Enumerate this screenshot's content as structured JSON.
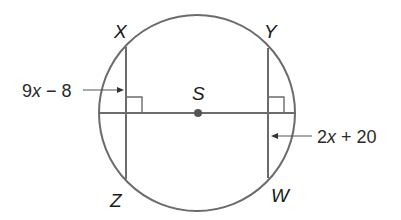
{
  "diagram": {
    "type": "circle-chords",
    "circle": {
      "center_label": "S",
      "cx": 197,
      "cy": 113,
      "r": 98
    },
    "points": {
      "X": {
        "label": "X"
      },
      "Y": {
        "label": "Y"
      },
      "Z": {
        "label": "Z"
      },
      "W": {
        "label": "W"
      },
      "S": {
        "label": "S"
      }
    },
    "chords": [
      {
        "name": "XZ",
        "from": "X",
        "to": "Z",
        "x": 126
      },
      {
        "name": "YW",
        "from": "Y",
        "to": "W",
        "x": 268
      }
    ],
    "right_angle_marks": 2,
    "measures": {
      "left": {
        "coef": "9",
        "var": "x",
        "op": " − ",
        "const": "8",
        "full": "9x − 8",
        "points_to": "segment from chord XZ to S (distance)"
      },
      "right": {
        "coef": "2",
        "var": "x",
        "op": " + ",
        "const": "20",
        "full": "2x + 20",
        "points_to": "segment from chord YW to S (distance)"
      }
    },
    "colors": {
      "line": "#6b6b6b",
      "text": "#1a1a1a",
      "dot": "#555555",
      "background": "#ffffff"
    }
  }
}
